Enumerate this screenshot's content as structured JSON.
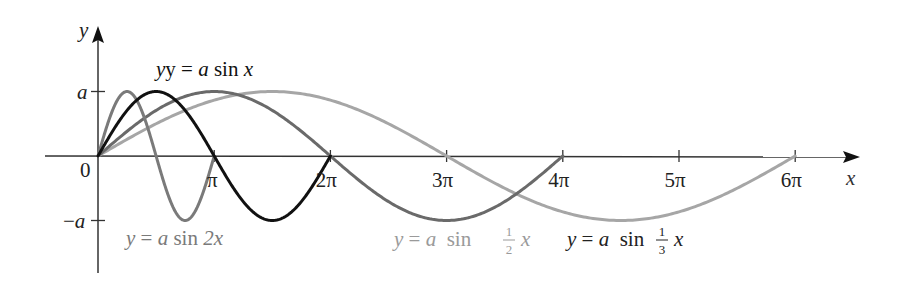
{
  "chart_data": {
    "type": "line",
    "title": "",
    "xlabel": "x",
    "ylabel": "y",
    "origin_label": "0",
    "y_ticks": [
      {
        "value": "a",
        "label": "a"
      },
      {
        "value": "-a",
        "label": "−a"
      }
    ],
    "x_ticks": [
      {
        "value": 1,
        "label": "π"
      },
      {
        "value": 2,
        "label": "2π"
      },
      {
        "value": 3,
        "label": "3π"
      },
      {
        "value": 4,
        "label": "4π"
      },
      {
        "value": 5,
        "label": "5π"
      },
      {
        "value": 6,
        "label": "6π"
      }
    ],
    "x_unit": "pi",
    "xlim": [
      0,
      6.7
    ],
    "ylim": [
      -1.7,
      2.0
    ],
    "series": [
      {
        "name": "y = a sin x",
        "k": 1,
        "color": "#111111",
        "x_end_pi": 2,
        "width": 3
      },
      {
        "name": "y = a sin 2x",
        "k": 2,
        "color": "#7a7a7a",
        "x_end_pi": 1,
        "width": 3
      },
      {
        "name": "y = a sin ½ x",
        "k": 0.5,
        "color": "#6a6a6a",
        "x_end_pi": 4,
        "width": 3
      },
      {
        "name": "y = a sin ⅓ x",
        "k": 0.3333333,
        "color": "#a6a6a6",
        "x_end_pi": 6,
        "width": 3
      }
    ],
    "grid": false,
    "legend": "inline annotations"
  },
  "labels": {
    "sinx": {
      "prefix": "y = ",
      "a": "a",
      "func": " sin ",
      "arg": "x"
    },
    "sin2x": {
      "prefix": "y = ",
      "a": "a",
      "func": " sin ",
      "arg": "2x"
    },
    "sinhalf": {
      "prefix": "y = ",
      "a": "a",
      "func": " sin ",
      "num": "1",
      "den": "2",
      "arg": "x"
    },
    "sinthird": {
      "prefix": "y = ",
      "a": "a",
      "func": " sin ",
      "num": "1",
      "den": "3",
      "arg": "x"
    }
  }
}
